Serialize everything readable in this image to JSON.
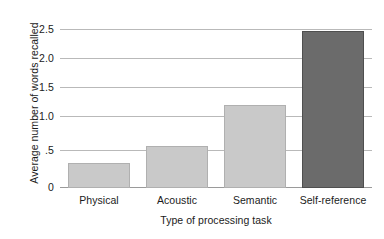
{
  "chart_data": {
    "type": "bar",
    "title": "",
    "subtitle": "",
    "xlabel": "Type of processing task",
    "ylabel": "Average number of words recalled",
    "categories": [
      "Physical",
      "Acoustic",
      "Semantic",
      "Self-reference"
    ],
    "values": [
      0.38,
      0.65,
      1.28,
      2.41
    ],
    "series": [
      {
        "name": "Average number of words recalled",
        "values": [
          0.38,
          0.65,
          1.28,
          2.41
        ]
      }
    ],
    "ylim": [
      0,
      2.5
    ],
    "yticks": [
      0,
      0.5,
      1.0,
      1.5,
      2.0,
      2.5
    ],
    "ytick_labels": [
      "0",
      ".5",
      "1.0",
      "1.5",
      "2.0",
      "2.5"
    ],
    "grid": true,
    "grid_axis": "y",
    "legend": false,
    "legend_position": "none",
    "bar_colors": [
      "#c9c9c9",
      "#c9c9c9",
      "#c9c9c9",
      "#6b6b6b"
    ],
    "bar_edge_colors": [
      "#b0b0b0",
      "#b0b0b0",
      "#b0b0b0",
      "#4f4f4f"
    ],
    "annotations": []
  },
  "colors": {
    "background": "#ffffff",
    "text": "#1b1b1b",
    "gridline": "#b9b9b9",
    "axis": "#9a9a9a",
    "bar_light": "#c9c9c9",
    "bar_dark": "#6b6b6b"
  }
}
